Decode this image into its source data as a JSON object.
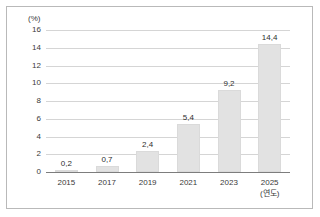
{
  "chart_data": {
    "type": "bar",
    "title": "",
    "subtitle": "",
    "xlabel": "(연도)",
    "ylabel": "(%)",
    "categories": [
      "2015",
      "2017",
      "2019",
      "2021",
      "2023",
      "2025"
    ],
    "values": [
      0.2,
      0.7,
      2.4,
      5.4,
      9.2,
      14.4
    ],
    "value_labels": [
      "0,2",
      "0,7",
      "2,4",
      "5,4",
      "9,2",
      "14,4"
    ],
    "ylim": [
      0,
      16
    ],
    "yticks": [
      0,
      2,
      4,
      6,
      8,
      10,
      12,
      14,
      16
    ],
    "ytick_labels": [
      "0",
      "2",
      "4",
      "6",
      "8",
      "10",
      "12",
      "14",
      "16"
    ],
    "grid": "horizontal",
    "legend": "none",
    "bar_color": "#e2e2e2",
    "gridline_color": "#d5d5d5",
    "axis_color": "#7d7d7d",
    "text_color": "#3a3a3a"
  }
}
